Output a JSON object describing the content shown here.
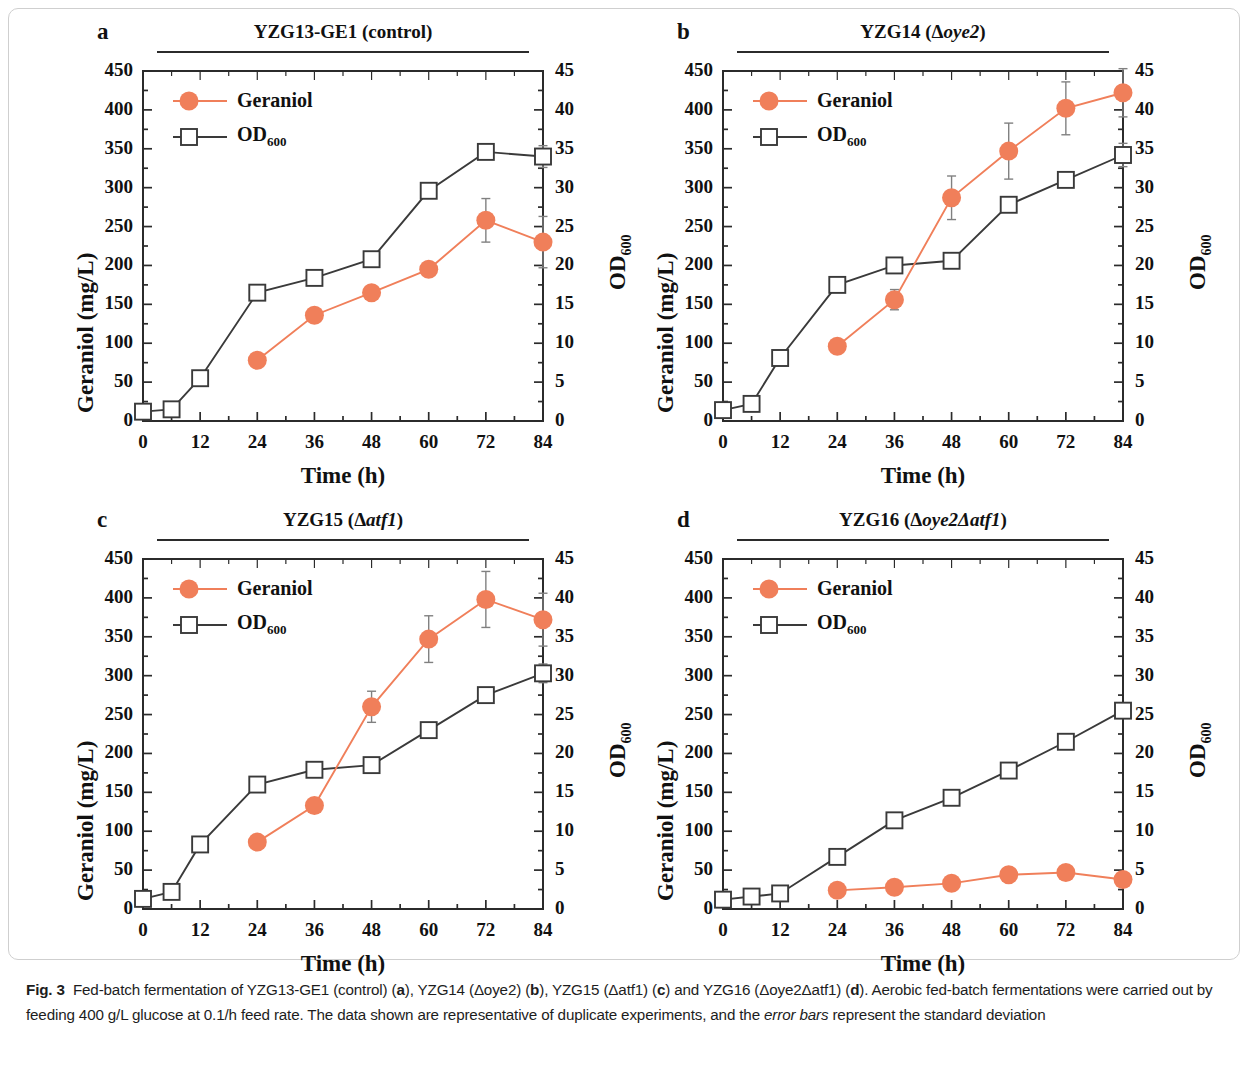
{
  "figure": {
    "label": "Fig. 3",
    "caption_parts": {
      "p1": "Fed-batch fermentation of YZG13-GE1 (control) (",
      "a": "a",
      "p2": "), YZG14 (Δoye2) (",
      "b": "b",
      "p3": "), YZG15 (Δatf1) (",
      "c": "c",
      "p4": ") and YZG16 (Δoye2Δatf1) (",
      "d": "d",
      "p5": "). Aerobic fed-batch fermentations were carried out by feeding 400 g/L glucose at 0.1/h feed rate. The data shown are representative of duplicate experiments, and the ",
      "em": "error bars",
      "p6": " represent the standard deviation"
    }
  },
  "shared": {
    "xlabel": "Time (h)",
    "ylabel_left": "Geraniol (mg/L)",
    "ylabel_right_main": "OD",
    "ylabel_right_sub": "600",
    "xticks": [
      0,
      12,
      24,
      36,
      48,
      60,
      72,
      84
    ],
    "yticks_left": [
      0,
      50,
      100,
      150,
      200,
      250,
      300,
      350,
      400,
      450
    ],
    "yticks_right": [
      0,
      5,
      10,
      15,
      20,
      25,
      30,
      35,
      40,
      45
    ],
    "xlim": [
      0,
      84
    ],
    "ylim_left": [
      0,
      450
    ],
    "ylim_right": [
      0,
      45
    ],
    "legend": {
      "geraniol": "Geraniol",
      "od_main": "OD",
      "od_sub": "600"
    },
    "colors": {
      "geraniol": "#F07F5A",
      "od600": "#3a3a3a",
      "axis": "#2b2b2b",
      "errorbar": "#808080"
    }
  },
  "chart_data": [
    {
      "type": "line",
      "panel": "a",
      "letter": "a",
      "title_main": "YZG13-GE1 (control)",
      "title_italic": "",
      "title_tail": "",
      "xlabel": "Time (h)",
      "ylabel": "Geraniol (mg/L)",
      "ylabel2": "OD600",
      "xlim": [
        0,
        84
      ],
      "ylim": [
        0,
        450
      ],
      "ylim2": [
        0,
        45
      ],
      "grid": false,
      "legend_position": "top-left",
      "series": [
        {
          "name": "Geraniol",
          "axis": "left",
          "x": [
            24,
            36,
            48,
            60,
            72,
            84
          ],
          "values": [
            78,
            136,
            165,
            195,
            258,
            230
          ],
          "errors": [
            6,
            7,
            8,
            7,
            28,
            33
          ]
        },
        {
          "name": "OD600",
          "axis": "right",
          "x": [
            0,
            6,
            12,
            24,
            36,
            48,
            60,
            72,
            84
          ],
          "values": [
            1.2,
            1.5,
            5.5,
            16.5,
            18.4,
            20.8,
            29.6,
            34.6,
            34.0
          ],
          "errors": [
            0.5,
            0.6,
            0.6,
            0.5,
            0.7,
            0.6,
            0.4,
            0.4,
            1.4
          ]
        }
      ]
    },
    {
      "type": "line",
      "panel": "b",
      "letter": "b",
      "title_main": "YZG14 (Δ",
      "title_italic": "oye2",
      "title_tail": ")",
      "xlabel": "Time (h)",
      "ylabel": "Geraniol (mg/L)",
      "ylabel2": "OD600",
      "xlim": [
        0,
        84
      ],
      "ylim": [
        0,
        450
      ],
      "ylim2": [
        0,
        45
      ],
      "grid": false,
      "legend_position": "top-left",
      "series": [
        {
          "name": "Geraniol",
          "axis": "left",
          "x": [
            24,
            36,
            48,
            60,
            72,
            84
          ],
          "values": [
            96,
            156,
            287,
            347,
            402,
            422
          ],
          "errors": [
            4,
            13,
            28,
            36,
            34,
            31
          ]
        },
        {
          "name": "OD600",
          "axis": "right",
          "x": [
            0,
            6,
            12,
            24,
            36,
            48,
            60,
            72,
            84
          ],
          "values": [
            1.4,
            2.2,
            8.1,
            17.5,
            20.0,
            20.6,
            27.8,
            31.0,
            34.2
          ],
          "errors": [
            0.5,
            0.6,
            0.7,
            0.6,
            0.4,
            0.4,
            0.5,
            0.4,
            1.5
          ]
        }
      ]
    },
    {
      "type": "line",
      "panel": "c",
      "letter": "c",
      "title_main": "YZG15 (Δ",
      "title_italic": "atf1",
      "title_tail": ")",
      "xlabel": "Time (h)",
      "ylabel": "Geraniol (mg/L)",
      "ylabel2": "OD600",
      "xlim": [
        0,
        84
      ],
      "ylim": [
        0,
        450
      ],
      "ylim2": [
        0,
        45
      ],
      "grid": false,
      "legend_position": "top-left",
      "series": [
        {
          "name": "Geraniol",
          "axis": "left",
          "x": [
            24,
            36,
            48,
            60,
            72,
            84
          ],
          "values": [
            86,
            133,
            260,
            347,
            398,
            372
          ],
          "errors": [
            4,
            5,
            20,
            30,
            36,
            34
          ]
        },
        {
          "name": "OD600",
          "axis": "right",
          "x": [
            0,
            6,
            12,
            24,
            36,
            48,
            60,
            72,
            84
          ],
          "values": [
            1.3,
            2.2,
            8.3,
            16.0,
            17.9,
            18.5,
            23.0,
            27.5,
            30.3
          ],
          "errors": [
            0.5,
            0.6,
            0.6,
            0.3,
            0.5,
            0.3,
            0.4,
            0.6,
            1.2
          ]
        }
      ]
    },
    {
      "type": "line",
      "panel": "d",
      "letter": "d",
      "title_main": "YZG16 (Δ",
      "title_italic": "oye2Δatf1",
      "title_tail": ")",
      "xlabel": "Time (h)",
      "ylabel": "Geraniol (mg/L)",
      "ylabel2": "OD600",
      "xlim": [
        0,
        84
      ],
      "ylim": [
        0,
        450
      ],
      "ylim2": [
        0,
        45
      ],
      "grid": false,
      "legend_position": "top-left",
      "series": [
        {
          "name": "Geraniol",
          "axis": "left",
          "x": [
            24,
            36,
            48,
            60,
            72,
            84
          ],
          "values": [
            24,
            28,
            33,
            44,
            47,
            38
          ],
          "errors": [
            2,
            2,
            2,
            2,
            2,
            2
          ]
        },
        {
          "name": "OD600",
          "axis": "right",
          "x": [
            0,
            6,
            12,
            24,
            36,
            48,
            60,
            72,
            84
          ],
          "values": [
            1.2,
            1.6,
            2.0,
            6.7,
            11.4,
            14.3,
            17.8,
            21.5,
            25.5
          ],
          "errors": [
            0.5,
            0.6,
            0.5,
            0.3,
            0.5,
            0.9,
            0.3,
            0.4,
            0.4
          ]
        }
      ]
    }
  ]
}
